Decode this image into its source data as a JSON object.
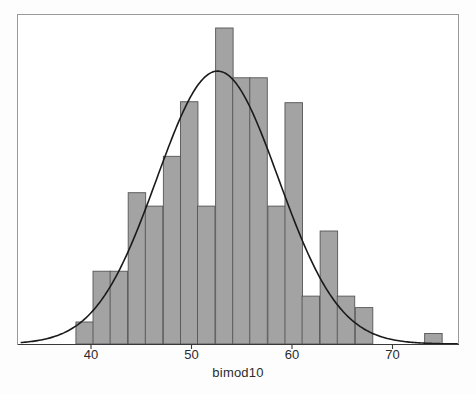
{
  "figure": {
    "background": "#ffffff",
    "frame_color": "#9a9a9a",
    "bar_fill": "#a3a3a3",
    "bar_stroke": "#555555",
    "curve_color": "#1a1a1a",
    "axis_color": "#3a3a3a"
  },
  "axis": {
    "label": "bimod10",
    "ticks": [
      {
        "value": 40,
        "label": "40"
      },
      {
        "value": 50,
        "label": "50"
      },
      {
        "value": 60,
        "label": "60"
      },
      {
        "value": 70,
        "label": "70"
      }
    ]
  },
  "chart_data": {
    "type": "bar",
    "title": "",
    "subtitle": "",
    "xlabel": "bimod10",
    "ylabel": "",
    "xlim": [
      33.0,
      76.5
    ],
    "ylim": [
      0,
      33
    ],
    "grid": false,
    "legend": null,
    "annotations": [],
    "bin_width": 1.74,
    "categories": [
      "38.5-40.2",
      "40.2-41.9",
      "41.9-43.7",
      "43.7-45.4",
      "45.4-47.2",
      "47.2-48.9",
      "48.9-50.6",
      "50.6-52.4",
      "52.4-54.1",
      "54.1-55.8",
      "55.8-57.6",
      "57.6-59.3",
      "59.3-61.0",
      "61.0-62.8",
      "62.8-64.5",
      "64.5-66.3",
      "66.3-68.0",
      "73.2-74.9"
    ],
    "bin_starts": [
      38.5,
      40.2,
      41.9,
      43.7,
      45.4,
      47.2,
      48.9,
      50.6,
      52.4,
      54.1,
      55.8,
      57.6,
      59.3,
      61.0,
      62.8,
      64.5,
      66.3,
      73.2
    ],
    "values": [
      2.3,
      7.6,
      7.6,
      15.8,
      14.4,
      19.6,
      25.3,
      14.4,
      33.0,
      27.8,
      27.8,
      14.4,
      25.2,
      5.0,
      11.8,
      5.0,
      3.8,
      1.1
    ],
    "series": [
      {
        "name": "bimod10 frequency",
        "values": [
          2.3,
          7.6,
          7.6,
          15.8,
          14.4,
          19.6,
          25.3,
          14.4,
          33.0,
          27.8,
          27.8,
          14.4,
          25.2,
          5.0,
          11.8,
          5.0,
          3.8,
          1.1
        ]
      }
    ],
    "overlay_curve": {
      "type": "normal-density",
      "name": "normal curve",
      "mean": 52.6,
      "sd": 6.05,
      "peak_value": 28.5,
      "color": "#1a1a1a"
    }
  }
}
